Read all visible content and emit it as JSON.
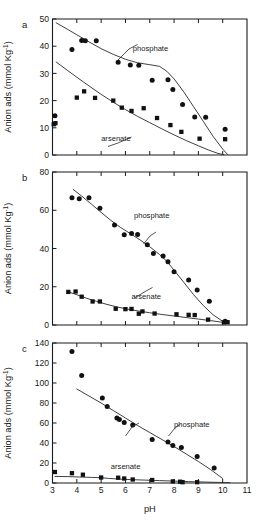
{
  "figure": {
    "axis_titles": {
      "y": "Anion ads (mmol Kg",
      "y_superscript": "-1",
      "y_close": ")",
      "x": "pH"
    },
    "colors": {
      "axis": "#1a1a1a",
      "marker": "#111111",
      "curve": "#2a2a2a",
      "background": "#ffffff"
    },
    "marker_legend": {
      "circle": "phosphate",
      "square": "arsenate"
    }
  },
  "chart_data": [
    {
      "type": "scatter",
      "panel": "a",
      "title": "",
      "xlabel": "pH",
      "ylabel": "Anion ads (mmol Kg-1)",
      "xlim": [
        3,
        11
      ],
      "ylim": [
        0,
        50
      ],
      "xticks": [
        3,
        4,
        5,
        6,
        7,
        8,
        9,
        10,
        11
      ],
      "xticklabels": [
        "",
        "",
        "",
        "",
        "",
        "",
        "",
        "",
        ""
      ],
      "yticks": [
        0,
        10,
        20,
        30,
        40,
        50
      ],
      "yticklabels": [
        "0",
        "10",
        "20",
        "30",
        "40",
        "50"
      ],
      "grid": false,
      "legend_position": "inline-annotation",
      "series": [
        {
          "name": "phosphate",
          "marker": "circle",
          "points": [
            [
              3.1,
              14.4
            ],
            [
              3.8,
              38.8
            ],
            [
              4.2,
              42.1
            ],
            [
              4.35,
              42.0
            ],
            [
              4.8,
              42.0
            ],
            [
              5.7,
              34.1
            ],
            [
              6.2,
              33.1
            ],
            [
              6.55,
              33.0
            ],
            [
              7.1,
              27.5
            ],
            [
              7.75,
              27.7
            ],
            [
              7.95,
              24.1
            ],
            [
              8.35,
              18.6
            ],
            [
              8.85,
              14.0
            ],
            [
              9.3,
              13.9
            ],
            [
              10.1,
              9.5
            ]
          ]
        },
        {
          "name": "arsenate",
          "marker": "square",
          "points": [
            [
              3.05,
              11.3
            ],
            [
              3.12,
              11.7
            ],
            [
              4.0,
              21.1
            ],
            [
              4.3,
              23.4
            ],
            [
              4.75,
              21.0
            ],
            [
              5.5,
              20.0
            ],
            [
              5.85,
              17.4
            ],
            [
              6.25,
              16.2
            ],
            [
              6.75,
              17.2
            ],
            [
              7.3,
              13.6
            ],
            [
              7.85,
              11.0
            ],
            [
              8.3,
              8.5
            ],
            [
              9.05,
              6.0
            ],
            [
              10.1,
              5.8
            ]
          ]
        }
      ],
      "fit_curves": [
        {
          "name": "phosphate-fit",
          "points": [
            [
              3.15,
              48.6
            ],
            [
              3.6,
              46.3
            ],
            [
              4.0,
              44.2
            ],
            [
              4.5,
              41.6
            ],
            [
              5.0,
              39.1
            ],
            [
              5.5,
              37.0
            ],
            [
              6.0,
              35.2
            ],
            [
              6.5,
              33.9
            ],
            [
              7.0,
              33.2
            ],
            [
              7.4,
              32.6
            ],
            [
              7.7,
              30.8
            ],
            [
              8.0,
              28.0
            ],
            [
              8.4,
              23.2
            ],
            [
              8.8,
              17.8
            ],
            [
              9.2,
              12.4
            ],
            [
              9.6,
              6.9
            ],
            [
              10.0,
              2.2
            ],
            [
              10.2,
              0.2
            ]
          ]
        },
        {
          "name": "arsenate-fit",
          "points": [
            [
              3.15,
              34.2
            ],
            [
              3.6,
              31.2
            ],
            [
              4.0,
              28.6
            ],
            [
              4.5,
              25.4
            ],
            [
              5.0,
              22.3
            ],
            [
              5.5,
              19.4
            ],
            [
              6.0,
              16.7
            ],
            [
              6.5,
              14.2
            ],
            [
              7.0,
              11.9
            ],
            [
              7.5,
              9.6
            ],
            [
              8.0,
              7.4
            ],
            [
              8.5,
              5.3
            ],
            [
              9.0,
              3.4
            ],
            [
              9.4,
              1.9
            ],
            [
              9.8,
              0.6
            ],
            [
              10.05,
              0.1
            ]
          ]
        }
      ],
      "annotations": [
        {
          "text": "phosphate",
          "x": 6.3,
          "y": 38.3
        },
        {
          "text": "arsenate",
          "x": 5.0,
          "y": 5.0
        }
      ]
    },
    {
      "type": "scatter",
      "panel": "b",
      "title": "",
      "xlabel": "pH",
      "ylabel": "Anion ads (mmol Kg-1)",
      "xlim": [
        3,
        11
      ],
      "ylim": [
        0,
        80
      ],
      "xticks": [
        3,
        4,
        5,
        6,
        7,
        8,
        9,
        10,
        11
      ],
      "xticklabels": [
        "",
        "",
        "",
        "",
        "",
        "",
        "",
        "",
        ""
      ],
      "yticks": [
        0,
        20,
        40,
        60,
        80
      ],
      "yticklabels": [
        "0",
        "20",
        "40",
        "60",
        "80"
      ],
      "grid": false,
      "legend_position": "inline-annotation",
      "series": [
        {
          "name": "phosphate",
          "marker": "circle",
          "points": [
            [
              3.8,
              66.5
            ],
            [
              4.1,
              66.0
            ],
            [
              4.5,
              66.6
            ],
            [
              4.95,
              61.0
            ],
            [
              5.55,
              52.3
            ],
            [
              5.95,
              47.2
            ],
            [
              6.25,
              47.9
            ],
            [
              6.5,
              47.3
            ],
            [
              6.9,
              41.9
            ],
            [
              7.15,
              37.4
            ],
            [
              7.55,
              36.1
            ],
            [
              7.75,
              33.1
            ],
            [
              8.0,
              27.9
            ],
            [
              8.6,
              23.5
            ],
            [
              8.95,
              18.3
            ],
            [
              9.45,
              12.4
            ],
            [
              10.1,
              1.9
            ]
          ]
        },
        {
          "name": "arsenate",
          "marker": "square",
          "points": [
            [
              3.65,
              17.3
            ],
            [
              3.95,
              17.5
            ],
            [
              4.2,
              14.8
            ],
            [
              4.65,
              12.3
            ],
            [
              4.95,
              12.3
            ],
            [
              5.6,
              8.5
            ],
            [
              6.0,
              8.3
            ],
            [
              6.25,
              8.4
            ],
            [
              6.55,
              5.9
            ],
            [
              6.7,
              7.1
            ],
            [
              7.2,
              6.0
            ],
            [
              8.1,
              5.6
            ],
            [
              8.6,
              5.3
            ],
            [
              8.85,
              5.2
            ],
            [
              9.4,
              2.8
            ],
            [
              10.05,
              1.4
            ],
            [
              10.2,
              1.5
            ]
          ]
        }
      ],
      "fit_curves": [
        {
          "name": "phosphate-fit",
          "points": [
            [
              3.85,
              70.9
            ],
            [
              4.2,
              67.4
            ],
            [
              4.6,
              63.2
            ],
            [
              5.0,
              58.9
            ],
            [
              5.4,
              54.7
            ],
            [
              5.8,
              51.0
            ],
            [
              6.2,
              47.8
            ],
            [
              6.6,
              44.5
            ],
            [
              7.0,
              40.9
            ],
            [
              7.4,
              36.9
            ],
            [
              7.7,
              33.3
            ],
            [
              8.0,
              28.7
            ],
            [
              8.4,
              22.3
            ],
            [
              8.8,
              15.9
            ],
            [
              9.2,
              10.2
            ],
            [
              9.6,
              5.4
            ],
            [
              10.0,
              1.9
            ],
            [
              10.25,
              0.6
            ]
          ]
        },
        {
          "name": "arsenate-fit",
          "points": [
            [
              3.6,
              17.6
            ],
            [
              4.0,
              15.8
            ],
            [
              4.4,
              14.0
            ],
            [
              4.8,
              12.4
            ],
            [
              5.2,
              10.9
            ],
            [
              5.6,
              9.6
            ],
            [
              6.0,
              8.5
            ],
            [
              6.5,
              7.4
            ],
            [
              7.0,
              6.4
            ],
            [
              7.5,
              5.5
            ],
            [
              8.0,
              4.7
            ],
            [
              8.5,
              3.9
            ],
            [
              9.0,
              3.1
            ],
            [
              9.5,
              2.3
            ],
            [
              10.0,
              1.4
            ],
            [
              10.25,
              0.9
            ]
          ]
        }
      ],
      "annotations": [
        {
          "text": "phosphate",
          "x": 6.35,
          "y": 56.0
        },
        {
          "text": "arsenate",
          "x": 6.25,
          "y": 13.5
        }
      ]
    },
    {
      "type": "scatter",
      "panel": "c",
      "title": "",
      "xlabel": "pH",
      "ylabel": "Anion ads (mmol Kg-1)",
      "xlim": [
        3,
        11
      ],
      "ylim": [
        0,
        140
      ],
      "xticks": [
        3,
        4,
        5,
        6,
        7,
        8,
        9,
        10,
        11
      ],
      "xticklabels": [
        "3",
        "4",
        "5",
        "6",
        "7",
        "8",
        "9",
        "10",
        "11"
      ],
      "yticks": [
        0,
        20,
        40,
        60,
        80,
        100,
        120,
        140
      ],
      "yticklabels": [
        "0",
        "20",
        "40",
        "60",
        "80",
        "100",
        "120",
        "140"
      ],
      "grid": false,
      "legend_position": "inline-annotation",
      "series": [
        {
          "name": "phosphate",
          "marker": "circle",
          "points": [
            [
              3.8,
              131.5
            ],
            [
              4.2,
              107.5
            ],
            [
              5.05,
              85.0
            ],
            [
              5.25,
              76.5
            ],
            [
              5.65,
              65.0
            ],
            [
              5.75,
              63.5
            ],
            [
              5.95,
              60.5
            ],
            [
              6.3,
              58.0
            ],
            [
              7.1,
              43.5
            ],
            [
              7.75,
              41.0
            ],
            [
              7.95,
              37.5
            ],
            [
              8.3,
              35.5
            ],
            [
              8.95,
              26.5
            ],
            [
              9.65,
              15.0
            ]
          ]
        },
        {
          "name": "arsenate",
          "marker": "square",
          "points": [
            [
              3.1,
              11.0
            ],
            [
              3.8,
              9.8
            ],
            [
              4.25,
              8.3
            ],
            [
              5.0,
              5.5
            ],
            [
              5.7,
              5.3
            ],
            [
              5.95,
              4.5
            ],
            [
              6.3,
              3.5
            ],
            [
              7.1,
              3.0
            ],
            [
              7.95,
              1.6
            ],
            [
              8.25,
              1.3
            ],
            [
              8.35,
              0.8
            ],
            [
              8.95,
              0.8
            ]
          ]
        }
      ],
      "fit_curves": [
        {
          "name": "phosphate-fit",
          "points": [
            [
              4.0,
              94.0
            ],
            [
              4.5,
              87.0
            ],
            [
              5.0,
              80.0
            ],
            [
              5.5,
              72.5
            ],
            [
              6.0,
              65.0
            ],
            [
              6.5,
              57.5
            ],
            [
              7.0,
              50.5
            ],
            [
              7.5,
              43.5
            ],
            [
              8.0,
              36.5
            ],
            [
              8.5,
              29.0
            ],
            [
              9.0,
              21.5
            ],
            [
              9.5,
              13.5
            ],
            [
              10.0,
              4.5
            ]
          ]
        },
        {
          "name": "arsenate-fit",
          "points": [
            [
              3.1,
              6.6
            ],
            [
              3.6,
              6.4
            ],
            [
              4.1,
              6.0
            ],
            [
              4.6,
              5.6
            ],
            [
              5.0,
              5.3
            ],
            [
              5.3,
              4.6
            ],
            [
              5.7,
              4.0
            ],
            [
              6.2,
              3.4
            ],
            [
              6.8,
              2.9
            ],
            [
              7.4,
              2.4
            ],
            [
              8.0,
              1.9
            ],
            [
              8.6,
              1.4
            ],
            [
              9.2,
              1.0
            ],
            [
              9.8,
              0.6
            ],
            [
              10.3,
              0.3
            ]
          ]
        }
      ],
      "annotations": [
        {
          "text": "phosphate",
          "x": 8.0,
          "y": 56.0
        },
        {
          "text": "arsenate",
          "x": 5.4,
          "y": 14.0
        }
      ]
    }
  ],
  "panels": [
    {
      "letter": "a"
    },
    {
      "letter": "b"
    },
    {
      "letter": "c"
    }
  ]
}
